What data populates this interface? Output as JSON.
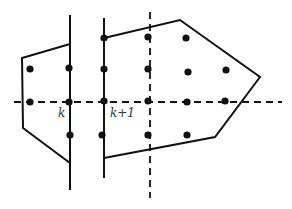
{
  "diagram": {
    "colors": {
      "stroke": "#111111",
      "label": "#333333",
      "background": "#ffffff"
    },
    "labels": [
      {
        "id": "label-k",
        "text": "k",
        "x": 58,
        "y": 117
      },
      {
        "id": "label-k-plus-1",
        "text": "k+1",
        "x": 110,
        "y": 117
      }
    ],
    "vertical_lines": [
      {
        "id": "line-k",
        "x": 70,
        "y1": 15,
        "y2": 190
      },
      {
        "id": "line-k-plus-1",
        "x": 104,
        "y1": 18,
        "y2": 178
      }
    ],
    "dashed_lines": [
      {
        "id": "horizontal-axis",
        "x1": 14,
        "y1": 102,
        "x2": 282,
        "y2": 102
      },
      {
        "id": "vertical-axis",
        "x1": 150,
        "y1": 12,
        "x2": 150,
        "y2": 198
      }
    ],
    "polygons": [
      {
        "id": "left-polygon",
        "points": "70,44 22,58 23,128 70,163"
      },
      {
        "id": "right-polygon",
        "points": "104,38 180,20 260,77 215,137 104,158"
      }
    ],
    "points": [
      [
        30,
        69
      ],
      [
        69,
        68
      ],
      [
        30,
        102
      ],
      [
        69,
        102
      ],
      [
        70,
        135
      ],
      [
        104,
        38
      ],
      [
        104,
        69
      ],
      [
        104,
        101
      ],
      [
        102,
        135
      ],
      [
        148,
        37
      ],
      [
        148,
        69
      ],
      [
        148,
        101
      ],
      [
        148,
        135
      ],
      [
        186,
        38
      ],
      [
        188,
        72
      ],
      [
        187,
        102
      ],
      [
        187,
        135
      ],
      [
        226,
        70
      ],
      [
        225,
        101
      ]
    ]
  }
}
